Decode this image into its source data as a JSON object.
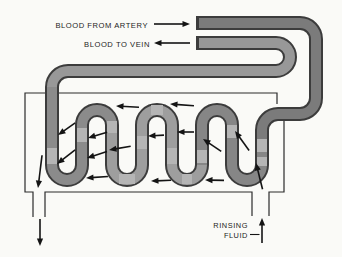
{
  "diagram": {
    "labels": {
      "blood_from_artery": "BLOOD FROM ARTERY",
      "blood_to_vein": "BLOOD TO VEIN",
      "rinsing_line1": "RINSING",
      "rinsing_line2": "FLUID"
    }
  },
  "colors": {
    "background": "#fafaf7",
    "tank_line": "#2b2b2b",
    "tube_outline": "#3c3c3c",
    "tube_artery": "#7b7b7b",
    "tube_serp_right": "#868686",
    "tube_serp_mid": "#9e9e9e",
    "tube_serp_left": "#8b8b8b",
    "tube_return": "#989898",
    "tube_patch": "#b5b5b5",
    "arrow": "#141414",
    "text": "#1c1c1c"
  },
  "arrows": [
    {
      "name": "artery-label-arrow",
      "x": 190,
      "y": 24,
      "angle": 0,
      "len": 36
    },
    {
      "name": "vein-label-arrow",
      "x": 154,
      "y": 43,
      "angle": 180,
      "len": 36
    },
    {
      "name": "rinsing-outlet-arrow",
      "x": 40,
      "y": 246,
      "angle": 90,
      "len": 27
    },
    {
      "name": "rinsing-inlet-arrow",
      "x": 262,
      "y": 218,
      "angle": 270,
      "len": 25
    },
    {
      "name": "tank-outlet-arrow",
      "x": 38,
      "y": 188,
      "angle": 97,
      "len": 33
    },
    {
      "name": "tank-inlet-arrow",
      "x": 256,
      "y": 163,
      "angle": 256,
      "len": 27
    },
    {
      "name": "flow-arrow-top-1",
      "x": 116,
      "y": 106,
      "angle": 183,
      "len": 23
    },
    {
      "name": "flow-arrow-top-2",
      "x": 170,
      "y": 104,
      "angle": 184,
      "len": 24
    },
    {
      "name": "flow-arrow-mid-1",
      "x": 58,
      "y": 135,
      "angle": 145,
      "len": 21
    },
    {
      "name": "flow-arrow-mid-2",
      "x": 88,
      "y": 138,
      "angle": 163,
      "len": 20
    },
    {
      "name": "flow-arrow-mid-3",
      "x": 57,
      "y": 164,
      "angle": 142,
      "len": 23
    },
    {
      "name": "flow-arrow-mid-4",
      "x": 87,
      "y": 158,
      "angle": 162,
      "len": 21
    },
    {
      "name": "flow-arrow-mid-5",
      "x": 109,
      "y": 150,
      "angle": 170,
      "len": 22
    },
    {
      "name": "flow-arrow-mid-6",
      "x": 148,
      "y": 136,
      "angle": 177,
      "len": 16
    },
    {
      "name": "flow-arrow-mid-7",
      "x": 177,
      "y": 132,
      "angle": 180,
      "len": 17
    },
    {
      "name": "flow-arrow-mid-8",
      "x": 203,
      "y": 139,
      "angle": 214,
      "len": 22
    },
    {
      "name": "flow-arrow-mid-9",
      "x": 235,
      "y": 131,
      "angle": 234,
      "len": 24
    },
    {
      "name": "flow-arrow-bottom-1",
      "x": 86,
      "y": 178,
      "angle": 176,
      "len": 22
    },
    {
      "name": "flow-arrow-bottom-2",
      "x": 151,
      "y": 181,
      "angle": 178,
      "len": 20
    },
    {
      "name": "flow-arrow-bottom-3",
      "x": 205,
      "y": 180,
      "angle": 181,
      "len": 19
    }
  ]
}
